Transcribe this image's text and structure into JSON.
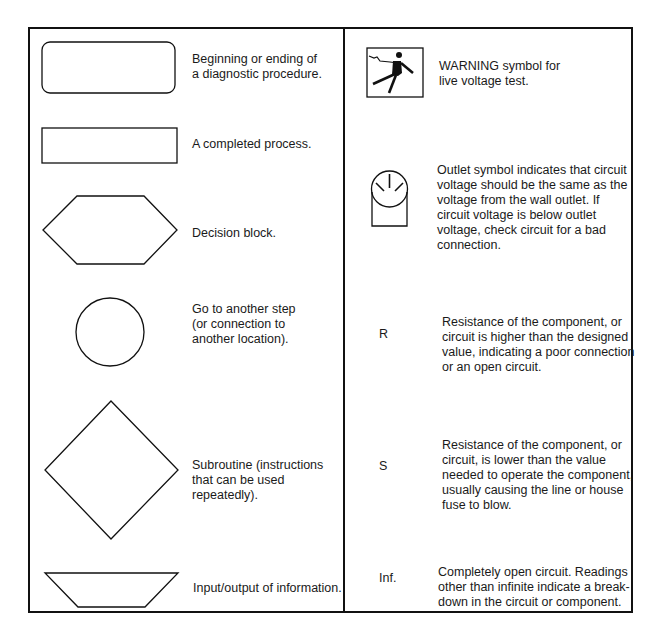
{
  "left_column": {
    "items": [
      {
        "symbol": "rounded-rectangle",
        "description": "Beginning or ending of\na diagnostic procedure.",
        "lines": [
          "Beginning or ending of",
          "a diagnostic procedure."
        ]
      },
      {
        "symbol": "rectangle",
        "description": "A completed process.",
        "lines": [
          "A completed process."
        ]
      },
      {
        "symbol": "hexagon",
        "description": "Decision block.",
        "lines": [
          "Decision block."
        ]
      },
      {
        "symbol": "circle",
        "description": "Go to another step (or connection to another location).",
        "lines": [
          "Go to another step",
          "(or connection to",
          "another location)."
        ]
      },
      {
        "symbol": "diamond",
        "description": "Subroutine (instructions that can be used repeatedly).",
        "lines": [
          "Subroutine (instructions",
          "that can be used",
          "repeatedly)."
        ]
      },
      {
        "symbol": "trapezoid",
        "description": "Input/output of information.",
        "lines": [
          "Input/output of information."
        ]
      }
    ]
  },
  "right_column": {
    "items": [
      {
        "symbol": "warning-electric-shock",
        "lines": [
          "WARNING symbol for",
          "live voltage test."
        ]
      },
      {
        "symbol": "outlet",
        "lines": [
          "Outlet symbol indicates that circuit",
          "voltage should be the same as the",
          "voltage from the wall outlet. If",
          "circuit voltage is below outlet",
          "voltage, check circuit  for a bad",
          "connection."
        ]
      },
      {
        "symbol": "R",
        "code": "R",
        "lines": [
          "Resistance of the component, or",
          "circuit is higher than the designed",
          "value, indicating a poor connection",
          "or an open circuit."
        ]
      },
      {
        "symbol": "S",
        "code": "S",
        "lines": [
          "Resistance of the component, or",
          "circuit, is lower than the value",
          "needed  to operate the component,",
          "usually causing the line or house",
          "fuse to blow."
        ]
      },
      {
        "symbol": "Inf.",
        "code": "Inf.",
        "lines": [
          "Completely open circuit.  Readings",
          "other than infinite indicate a break-",
          "down in the circuit or component."
        ]
      }
    ]
  },
  "colors": {
    "line": "#111111",
    "text": "#1a1a1a",
    "background": "#ffffff"
  }
}
